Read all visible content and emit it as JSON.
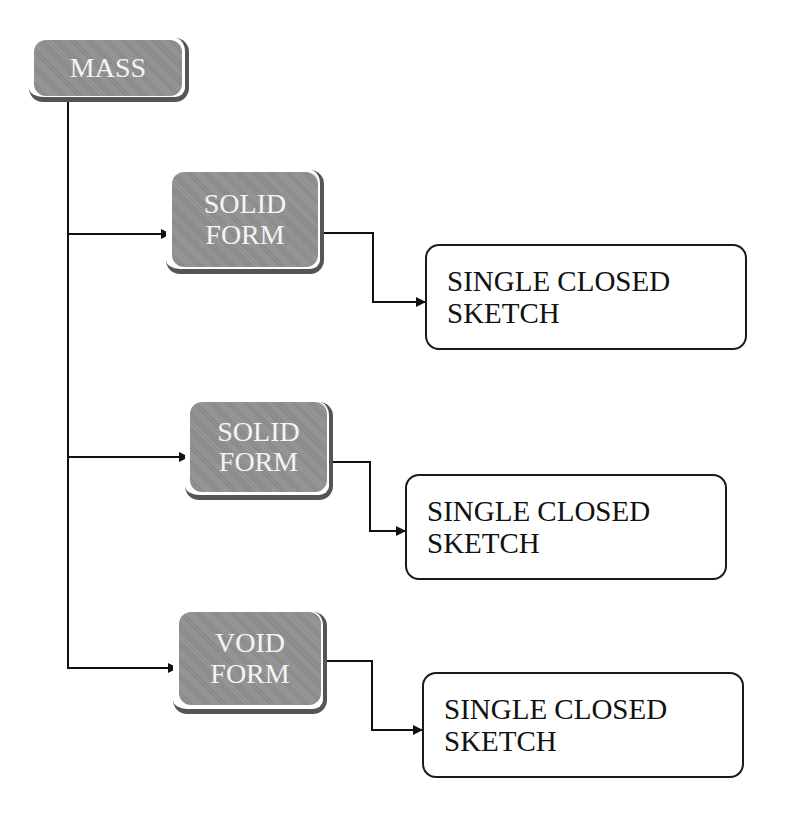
{
  "diagram": {
    "root": {
      "label": "MASS",
      "color": "#8f8f8f"
    },
    "branches": [
      {
        "form": {
          "line1": "SOLID",
          "line2": "FORM"
        },
        "target": {
          "line1": "SINGLE CLOSED",
          "line2": "SKETCH"
        }
      },
      {
        "form": {
          "line1": "SOLID",
          "line2": "FORM"
        },
        "target": {
          "line1": "SINGLE CLOSED",
          "line2": "SKETCH"
        }
      },
      {
        "form": {
          "line1": "VOID",
          "line2": "FORM"
        },
        "target": {
          "line1": "SINGLE CLOSED",
          "line2": "SKETCH"
        }
      }
    ],
    "colors": {
      "form_fill": "#8f8f8f",
      "line": "#111111",
      "shadow": "#555555"
    }
  }
}
